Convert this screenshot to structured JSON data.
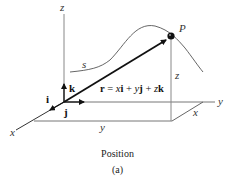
{
  "figure": {
    "caption": "Position",
    "sublabel": "(a)"
  },
  "axes": {
    "z": "z",
    "x": "x",
    "y": "y"
  },
  "unit_vectors": {
    "i": "i",
    "j": "j",
    "k": "k"
  },
  "point": {
    "label": "P"
  },
  "path": {
    "label": "s"
  },
  "position_vector": {
    "lhs": "r",
    "eq": " = ",
    "x": "x",
    "i": "i",
    "plus1": " + ",
    "y": "y",
    "j": "j",
    "plus2": " + ",
    "z": "z",
    "k": "k"
  },
  "projections": {
    "z_height": "z",
    "x_offset": "x",
    "y_distance": "y"
  },
  "colors": {
    "axis": "#888888",
    "vector": "#111111",
    "curve": "#555555"
  }
}
